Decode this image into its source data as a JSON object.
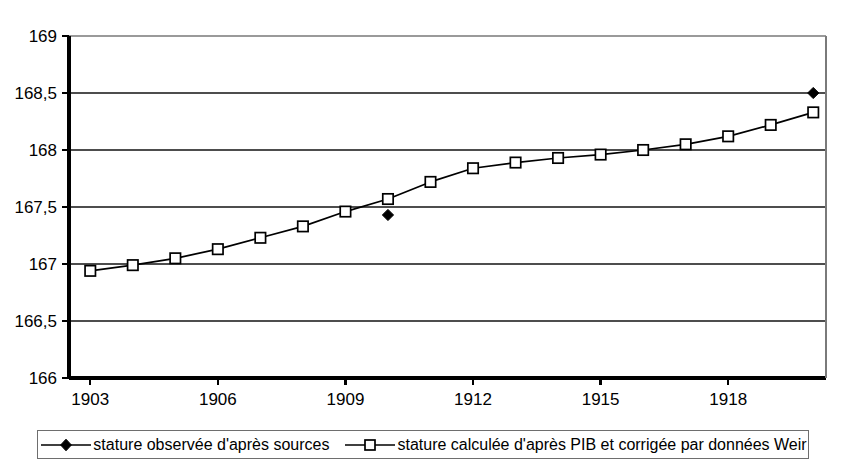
{
  "chart_data": {
    "type": "line",
    "title": "",
    "subtitle": "",
    "xlabel": "",
    "ylabel": "",
    "xlim": [
      1902.5,
      1920.3
    ],
    "ylim": [
      166,
      169
    ],
    "grid": true,
    "legend_position": "bottom",
    "x_ticks": [
      1903,
      1906,
      1909,
      1912,
      1915,
      1918
    ],
    "x_tick_labels": [
      "1903",
      "1906",
      "1909",
      "1912",
      "1915",
      "1918"
    ],
    "y_ticks": [
      166,
      166.5,
      167,
      167.5,
      168,
      168.5,
      169
    ],
    "y_tick_labels": [
      "166",
      "166,5",
      "167",
      "167,5",
      "168",
      "168,5",
      "169"
    ],
    "series": [
      {
        "name": "stature observée d'après sources",
        "marker": "filled-diamond",
        "line": "none",
        "x": [
          1910,
          1920
        ],
        "values": [
          167.43,
          168.5
        ]
      },
      {
        "name": "stature calculée d'après PIB et corrigée par données Weir",
        "marker": "open-square",
        "line": "solid",
        "x": [
          1903,
          1904,
          1905,
          1906,
          1907,
          1908,
          1909,
          1910,
          1911,
          1912,
          1913,
          1914,
          1915,
          1916,
          1917,
          1918,
          1919,
          1920
        ],
        "values": [
          166.94,
          166.99,
          167.05,
          167.13,
          167.23,
          167.33,
          167.46,
          167.57,
          167.72,
          167.84,
          167.89,
          167.93,
          167.96,
          168.0,
          168.05,
          168.12,
          168.22,
          168.33
        ]
      }
    ]
  },
  "legend": {
    "entries": [
      {
        "label": "stature observée d'après sources",
        "marker": "filled-diamond"
      },
      {
        "label": "stature calculée d'après PIB et corrigée par données Weir",
        "marker": "open-square"
      }
    ]
  },
  "colors": {
    "series_stroke": "#000000",
    "marker_fill": "#ffffff",
    "gridline": "#4d4d4d",
    "axis": "#000000",
    "background": "#ffffff"
  }
}
